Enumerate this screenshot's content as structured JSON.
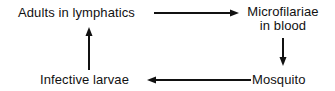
{
  "diagram": {
    "type": "cycle",
    "nodes": [
      {
        "id": "adults",
        "label": "Adults in lymphatics"
      },
      {
        "id": "microfilariae",
        "label_line1": "Microfilariae",
        "label_line2": "in blood"
      },
      {
        "id": "mosquito",
        "label": "Mosquito"
      },
      {
        "id": "larvae",
        "label": "Infective larvae"
      }
    ],
    "edges": [
      {
        "from": "adults",
        "to": "microfilariae"
      },
      {
        "from": "microfilariae",
        "to": "mosquito"
      },
      {
        "from": "mosquito",
        "to": "larvae"
      },
      {
        "from": "larvae",
        "to": "adults"
      }
    ],
    "colors": {
      "ink": "#111111",
      "background": "#ffffff"
    }
  }
}
